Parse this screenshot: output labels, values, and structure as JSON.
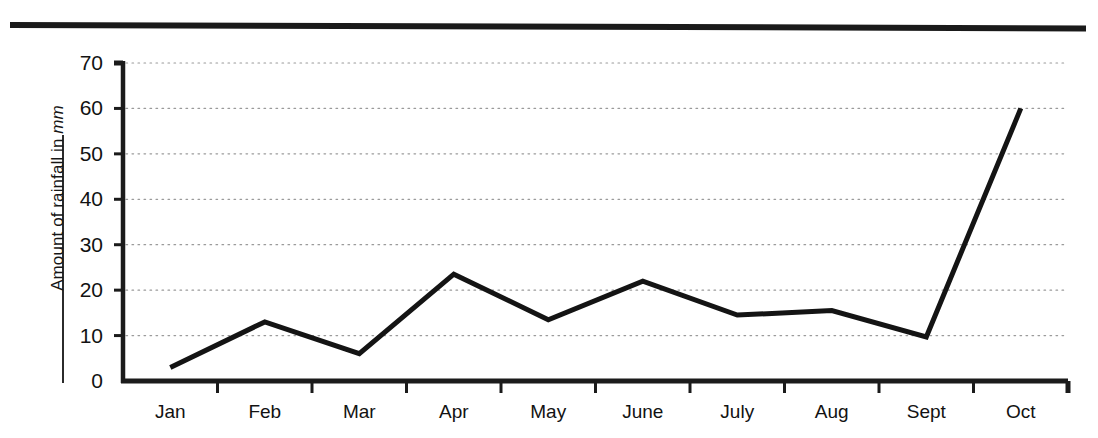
{
  "page": {
    "background_color": "#ffffff",
    "ink_color": "#111111"
  },
  "decor": {
    "top_rule_name": "horizontal-rule"
  },
  "chart_data": {
    "type": "line",
    "title": "",
    "subtitle": "",
    "xlabel": "",
    "ylabel": "Amount of rainfall in mm",
    "ylabel_parts": {
      "text": "Amount of rainfall in ",
      "unit": "mm"
    },
    "categories": [
      "Jan",
      "Feb",
      "Mar",
      "Apr",
      "May",
      "June",
      "July",
      "Aug",
      "Sept",
      "Oct"
    ],
    "values": [
      3,
      13,
      6,
      23.5,
      13.5,
      22,
      14.5,
      15.5,
      9.7,
      60
    ],
    "series": [
      {
        "name": "Rainfall",
        "values": [
          3,
          13,
          6,
          23.5,
          13.5,
          22,
          14.5,
          15.5,
          9.7,
          60
        ]
      }
    ],
    "ylim": [
      0,
      70
    ],
    "yticks": [
      0,
      10,
      20,
      30,
      40,
      50,
      60,
      70
    ],
    "ytick_labels": [
      "0",
      "10",
      "20",
      "30",
      "40",
      "50",
      "60",
      "70"
    ],
    "xtick_labels": [
      "Jan",
      "Feb",
      "Mar",
      "Apr",
      "May",
      "June",
      "July",
      "Aug",
      "Sept",
      "Oct"
    ],
    "grid": true,
    "grid_style": "dotted",
    "grid_color": "#9a9a9a",
    "legend": false,
    "legend_position": "none",
    "line_color": "#141414",
    "line_width": 5,
    "markers": false,
    "annotations": []
  }
}
